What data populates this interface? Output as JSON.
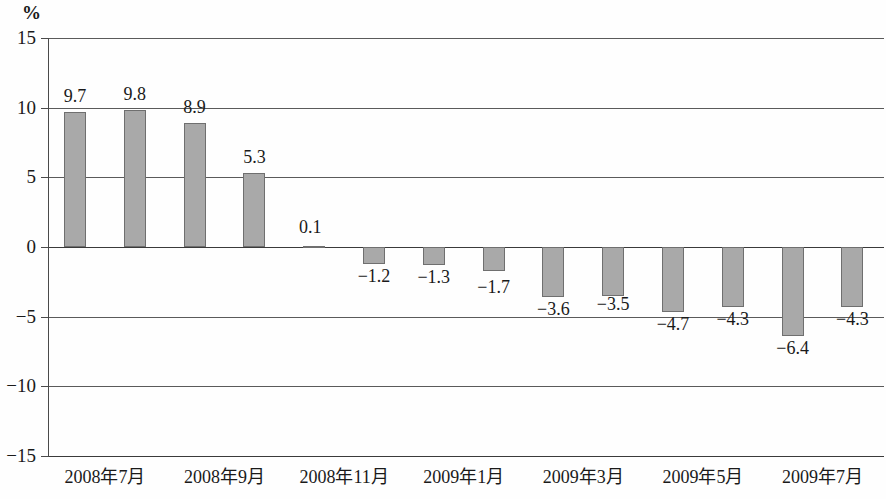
{
  "chart_data": {
    "type": "bar",
    "title": "",
    "subtitle": "",
    "xlabel": "",
    "ylabel": "%",
    "unit_label": "%",
    "ylim": [
      -15,
      15
    ],
    "ytick_labels": [
      "15",
      "10",
      "5",
      "0",
      "−5",
      "−10",
      "−15"
    ],
    "ytick_values": [
      15,
      10,
      5,
      0,
      -5,
      -10,
      -15
    ],
    "grid": true,
    "grid_orientation": "horizontal",
    "legend": null,
    "legend_position": "none",
    "bar_color": "#a9a9a9",
    "bar_border_color": "#6f6f6f",
    "axis_color": "#4a4a4a",
    "categories": [
      "2008年7月",
      "2008年8月",
      "2008年9月",
      "2008年10月",
      "2008年11月",
      "2008年12月",
      "2009年1月",
      "2009年2月",
      "2009年3月",
      "2009年4月",
      "2009年5月",
      "2009年6月",
      "2009年7月",
      "2009年8月"
    ],
    "values": [
      9.7,
      9.8,
      8.9,
      5.3,
      0.1,
      -1.2,
      -1.3,
      -1.7,
      -3.6,
      -3.5,
      -4.7,
      -4.3,
      -6.4,
      -4.3
    ],
    "value_labels": [
      "9.7",
      "9.8",
      "8.9",
      "5.3",
      "0.1",
      "−1.2",
      "−1.3",
      "−1.7",
      "−3.6",
      "−3.5",
      "−4.7",
      "−4.3",
      "−6.4",
      "−4.3"
    ],
    "xtick_labels": [
      {
        "text": "2008年7月",
        "index": 0
      },
      {
        "text": "2008年9月",
        "index": 2
      },
      {
        "text": "2008年11月",
        "index": 4
      },
      {
        "text": "2009年1月",
        "index": 6
      },
      {
        "text": "2009年3月",
        "index": 8
      },
      {
        "text": "2009年5月",
        "index": 10
      },
      {
        "text": "2009年7月",
        "index": 12
      }
    ]
  }
}
